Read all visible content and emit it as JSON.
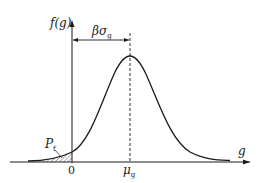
{
  "diagram": {
    "type": "probability-density-of-limit-state-function",
    "y_axis_label": "f(g)",
    "x_axis_label": "g",
    "origin_label": "0",
    "mean_label": "μ",
    "mean_subscript": "g",
    "distance_label_beta": "β",
    "distance_label_sigma": "σ",
    "distance_subscript": "g",
    "failure_prob_label": "P",
    "failure_prob_subscript": "f",
    "colors": {
      "line": "#1a1a1a",
      "hatch": "#555555",
      "background": "#ffffff"
    }
  }
}
